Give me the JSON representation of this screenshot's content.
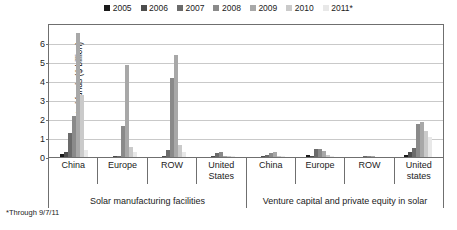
{
  "footnote": "*Through 9/7/11",
  "chart_data": {
    "type": "bar",
    "title": "",
    "xlabel": "",
    "ylabel": "Invested funds ($ billion)",
    "ylim": [
      0,
      7
    ],
    "yticks": [
      0,
      1,
      2,
      3,
      4,
      5,
      6
    ],
    "grid": true,
    "legend_position": "top-center",
    "legend": [
      "2005",
      "2006",
      "2007",
      "2008",
      "2009",
      "2010",
      "2011*"
    ],
    "series_colors": [
      "#1a1a1a",
      "#4d4d4d",
      "#6b6b6b",
      "#8a8a8a",
      "#a8a8a8",
      "#cacaca",
      "#e8e8e8"
    ],
    "sections": [
      {
        "label": "Solar manufacturing facilities",
        "span": 4
      },
      {
        "label": "Venture capital and private equity in solar",
        "span": 4
      }
    ],
    "categories": [
      "China",
      "Europe",
      "ROW",
      "United States",
      "China",
      "Europe",
      "ROW",
      "United states"
    ],
    "series": [
      {
        "name": "2005",
        "values": [
          0.2,
          0.05,
          0.05,
          0.05,
          0.05,
          0.15,
          0.03,
          0.15
        ]
      },
      {
        "name": "2006",
        "values": [
          0.3,
          0.08,
          0.1,
          0.1,
          0.1,
          0.1,
          0.05,
          0.3
        ]
      },
      {
        "name": "2007",
        "values": [
          1.3,
          0.1,
          0.4,
          0.25,
          0.18,
          0.45,
          0.08,
          0.55
        ]
      },
      {
        "name": "2008",
        "values": [
          2.2,
          1.7,
          4.2,
          0.3,
          0.25,
          0.5,
          0.12,
          1.8
        ]
      },
      {
        "name": "2009",
        "values": [
          6.6,
          4.9,
          5.4,
          0.12,
          0.3,
          0.35,
          0.1,
          1.9
        ]
      },
      {
        "name": "2010",
        "values": [
          3.3,
          0.6,
          0.7,
          0.1,
          0.12,
          0.15,
          0.05,
          1.4
        ]
      },
      {
        "name": "2011*",
        "values": [
          0.4,
          0.3,
          0.3,
          0.08,
          0.1,
          0.12,
          0.04,
          1.1
        ]
      }
    ]
  }
}
